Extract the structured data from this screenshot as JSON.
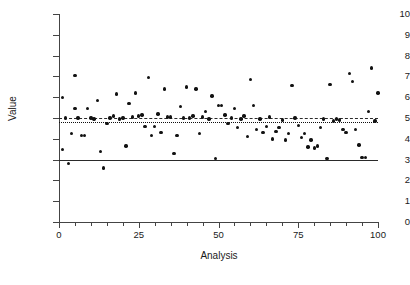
{
  "chart_data": {
    "type": "scatter",
    "title": "",
    "xlabel": "Analysis",
    "ylabel": "Value",
    "xlim": [
      0,
      100
    ],
    "ylim": [
      0,
      10
    ],
    "grid": false,
    "legend": "none",
    "x_ticks": [
      0,
      25,
      50,
      75,
      100
    ],
    "x_tick_labels": [
      "0",
      "25",
      "50",
      "75",
      "100"
    ],
    "x_minor_tick_step": 5,
    "y_ticks": [
      0,
      1,
      2,
      3,
      4,
      5,
      6,
      7,
      8,
      9,
      10
    ],
    "y_tick_labels": [
      "0",
      "1",
      "2",
      "3",
      "4",
      "5",
      "6",
      "7",
      "8",
      "9",
      "10"
    ],
    "marker": "filled-circle",
    "marker_color": "#111111",
    "reference_lines": [
      {
        "name": "mean-line",
        "style": "dashed",
        "value": 5.0,
        "color": "#2a2a2a"
      },
      {
        "name": "target-line",
        "style": "dotted",
        "value": 4.82,
        "color": "#111111"
      },
      {
        "name": "lower-limit-line",
        "style": "solid",
        "value": 3.0,
        "color": "#2a2a2a"
      }
    ],
    "x": [
      1,
      1,
      2,
      3,
      4,
      5,
      5,
      6,
      7,
      8,
      9,
      10,
      11,
      12,
      13,
      14,
      15,
      16,
      17,
      18,
      19,
      20,
      21,
      22,
      23,
      24,
      25,
      26,
      27,
      28,
      29,
      30,
      31,
      32,
      33,
      34,
      35,
      36,
      37,
      38,
      39,
      40,
      41,
      42,
      43,
      44,
      45,
      46,
      47,
      48,
      49,
      50,
      51,
      52,
      53,
      54,
      55,
      56,
      57,
      58,
      59,
      60,
      61,
      62,
      63,
      64,
      65,
      66,
      67,
      68,
      69,
      70,
      71,
      72,
      73,
      74,
      75,
      76,
      77,
      78,
      79,
      80,
      81,
      82,
      83,
      84,
      85,
      86,
      87,
      88,
      89,
      90,
      91,
      92,
      93,
      94,
      95,
      96,
      97,
      98,
      99,
      100
    ],
    "y": [
      3.5,
      6.0,
      5.0,
      2.8,
      4.25,
      7.05,
      5.45,
      5.0,
      4.15,
      4.15,
      5.45,
      5.0,
      4.95,
      5.85,
      3.4,
      2.6,
      4.75,
      5.0,
      5.1,
      6.15,
      4.95,
      5.0,
      3.65,
      5.7,
      5.05,
      6.2,
      5.1,
      5.15,
      4.6,
      6.95,
      4.15,
      4.6,
      5.2,
      4.3,
      6.4,
      5.05,
      5.05,
      3.3,
      4.15,
      5.55,
      5.0,
      6.5,
      5.0,
      5.1,
      6.4,
      4.25,
      5.05,
      5.3,
      4.95,
      6.05,
      3.05,
      5.6,
      5.6,
      5.15,
      4.75,
      5.0,
      5.45,
      4.55,
      4.95,
      5.1,
      4.1,
      6.85,
      5.6,
      4.45,
      4.95,
      4.3,
      4.6,
      5.05,
      4.0,
      4.35,
      4.55,
      4.9,
      3.95,
      4.25,
      6.55,
      5.0,
      4.65,
      4.05,
      4.25,
      3.6,
      3.95,
      3.55,
      3.65,
      4.55,
      4.95,
      3.05,
      6.6,
      4.85,
      4.95,
      4.9,
      4.45,
      4.3,
      7.15,
      6.75,
      4.45,
      3.7,
      3.1,
      3.1,
      5.3,
      7.4,
      4.85,
      6.2
    ]
  }
}
